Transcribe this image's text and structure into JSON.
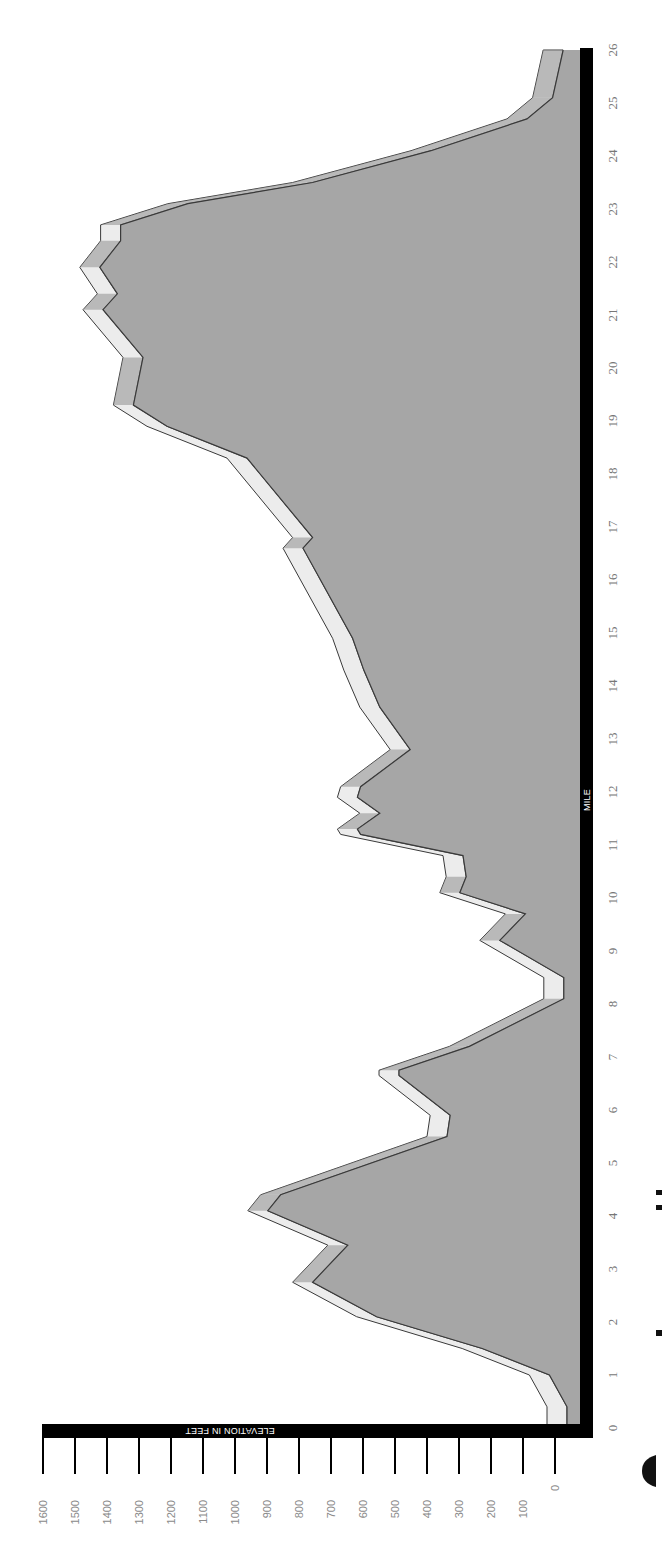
{
  "chart_data": {
    "type": "area",
    "title": "",
    "orientation": "rotated-90",
    "xlabel": "MILE",
    "ylabel": "ELEVATION IN FEET",
    "xlim": [
      0,
      26
    ],
    "ylim": [
      0,
      1600
    ],
    "x_ticks": [
      0,
      1,
      2,
      3,
      4,
      5,
      6,
      7,
      8,
      9,
      10,
      11,
      12,
      13,
      14,
      15,
      16,
      17,
      18,
      19,
      20,
      21,
      22,
      23,
      24,
      25,
      26
    ],
    "y_ticks": [
      0,
      100,
      200,
      300,
      400,
      500,
      600,
      700,
      800,
      900,
      1000,
      1100,
      1200,
      1300,
      1400,
      1500,
      1600
    ],
    "grid": false,
    "legend": null,
    "series": [
      {
        "name": "Elevation profile",
        "x": [
          0,
          0.4,
          1.0,
          1.5,
          2.1,
          2.75,
          3.45,
          4.1,
          4.4,
          5.5,
          5.9,
          6.65,
          6.75,
          7.2,
          8.1,
          8.5,
          9.2,
          9.7,
          10.1,
          10.4,
          10.8,
          11.2,
          11.3,
          11.6,
          11.9,
          12.1,
          12.8,
          13.6,
          14.3,
          14.9,
          16.6,
          16.8,
          18.3,
          18.9,
          19.3,
          20.2,
          21.1,
          21.4,
          21.9,
          22.4,
          22.7,
          23.1,
          23.5,
          24.1,
          24.7,
          25.1,
          26
        ],
        "values": [
          25,
          25,
          80,
          290,
          620,
          820,
          710,
          960,
          920,
          400,
          390,
          550,
          550,
          330,
          35,
          35,
          235,
          155,
          360,
          340,
          350,
          670,
          680,
          610,
          680,
          670,
          515,
          610,
          660,
          695,
          850,
          820,
          1025,
          1275,
          1380,
          1350,
          1475,
          1430,
          1485,
          1420,
          1420,
          1210,
          820,
          450,
          150,
          70,
          37
        ]
      }
    ],
    "colors": {
      "fill": "#a6a6a6",
      "ribbon": "#ececec",
      "ribbon_shadow": "#8f8f8f",
      "outline": "#3a3a3a",
      "axis": "#000000"
    }
  },
  "labels": {
    "x_axis_title": "MILE",
    "y_axis_title": "ELEVATION IN FEET"
  }
}
